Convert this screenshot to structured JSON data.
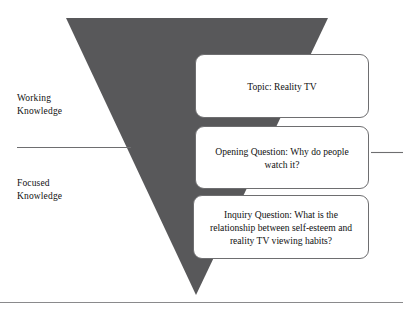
{
  "figure": {
    "background_color": "#ffffff",
    "funnel_color": "#58585a",
    "rule_color": "#6e6e70",
    "box_border_color": "#6e6e70",
    "box_fill_color": "#ffffff",
    "text_color": "#111111"
  },
  "stage_labels": [
    {
      "name": "working-knowledge",
      "text": "Working\nKnowledge"
    },
    {
      "name": "focused-knowledge",
      "text": "Focused\nKnowledge"
    }
  ],
  "callouts": [
    {
      "name": "topic",
      "text": "Topic: Reality TV"
    },
    {
      "name": "opening-question",
      "text": "Opening Question: Why do people watch it?"
    },
    {
      "name": "inquiry-question",
      "text": "Inquiry Question: What is the relationship between self-esteem and reality TV viewing habits?"
    }
  ],
  "rules": {
    "divider_left": "horizontal divider separating working knowledge from focused knowledge",
    "divider_right": "horizontal divider continuation right of callouts",
    "bottom_rule": "full width bottom rule"
  }
}
